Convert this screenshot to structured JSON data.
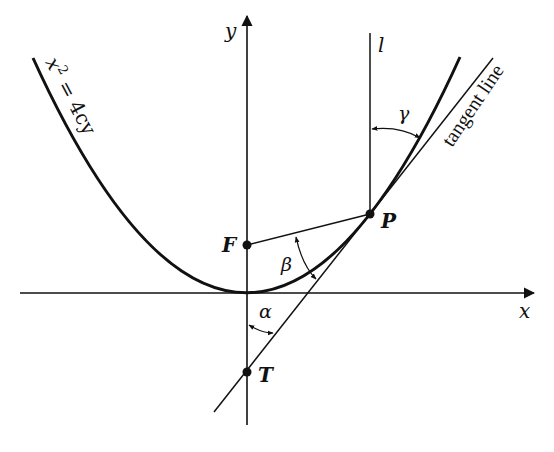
{
  "diagram": {
    "axes": {
      "x_label": "x",
      "y_label": "y"
    },
    "curve": {
      "equation_label_base": "x",
      "equation_label_exp": "2",
      "equation_label_rest": " = 4cy"
    },
    "points": {
      "focus": "F",
      "point_on_curve": "P",
      "tangent_intercept": "T"
    },
    "lines": {
      "vertical_line_label": "l",
      "tangent_label": "tangent line"
    },
    "angles": {
      "alpha": "α",
      "beta": "β",
      "gamma": "γ"
    },
    "colors": {
      "ink": "#111111",
      "background": "#ffffff"
    }
  }
}
